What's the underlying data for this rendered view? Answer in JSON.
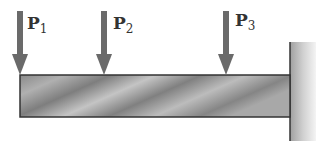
{
  "diagram": {
    "type": "cantilever-beam",
    "loads": [
      {
        "label": "P",
        "subscript": "1",
        "x": 20
      },
      {
        "label": "P",
        "subscript": "2",
        "x": 104
      },
      {
        "label": "P",
        "subscript": "3",
        "x": 226
      }
    ],
    "support": "fixed-wall-right",
    "colors": {
      "arrow": "#6a6a6a",
      "beam": "#9a9a9a",
      "wall": "#c8c8c8",
      "outline": "#333333"
    }
  }
}
